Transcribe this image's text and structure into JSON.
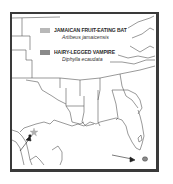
{
  "map": {
    "region": "Southeastern United States and Gulf of Mexico",
    "legend": [
      {
        "common_name": "JAMAICAN FRUIT-EATING BAT",
        "scientific_name": "Artibeus jamaicensis",
        "color": "#b8b8b8"
      },
      {
        "common_name": "HAIRY-LEGGED VAMPIRE",
        "scientific_name": "Diphylla ecaudata",
        "color": "#8a8a8a"
      }
    ],
    "markers": [
      {
        "type": "star",
        "location": "South Texas",
        "color": "#b0b0b0"
      },
      {
        "type": "arrow",
        "location": "South Texas",
        "color": "#222222"
      },
      {
        "type": "arrow",
        "location": "Florida Keys",
        "color": "#222222"
      },
      {
        "type": "range-patch",
        "location": "South Florida",
        "color": "#8a8a8a"
      }
    ]
  }
}
